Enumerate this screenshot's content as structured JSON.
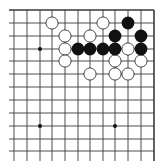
{
  "board": {
    "description": "Go board diagram (top-right corner section)",
    "edges": {
      "top": true,
      "right": true,
      "left": false,
      "bottom": false
    },
    "columns": 12,
    "rows": 12,
    "x_positions": [
      14,
      27,
      40,
      52,
      65,
      78,
      90,
      103,
      115,
      128,
      141,
      154
    ],
    "y_positions": [
      10,
      23,
      36,
      49,
      61,
      74,
      87,
      100,
      113,
      126,
      139,
      151
    ],
    "colors": {
      "background": "#ffffff",
      "line": "#3a3a3a",
      "black_stone": "#111111",
      "white_stone_fill": "#ffffff",
      "white_stone_stroke": "#333333"
    },
    "star_points": [
      [
        2,
        3
      ],
      [
        2,
        9
      ],
      [
        8,
        9
      ]
    ],
    "stones": {
      "white": [
        [
          3,
          1
        ],
        [
          7,
          1
        ],
        [
          4,
          2
        ],
        [
          6,
          2
        ],
        [
          4,
          3
        ],
        [
          9,
          3
        ],
        [
          4,
          4
        ],
        [
          8,
          4
        ],
        [
          10,
          4
        ],
        [
          6,
          5
        ],
        [
          8,
          5
        ],
        [
          9,
          5
        ]
      ],
      "black": [
        [
          9,
          1
        ],
        [
          8,
          2
        ],
        [
          10,
          2
        ],
        [
          5,
          3
        ],
        [
          6,
          3
        ],
        [
          7,
          3
        ],
        [
          8,
          3
        ],
        [
          10,
          3
        ]
      ]
    }
  }
}
